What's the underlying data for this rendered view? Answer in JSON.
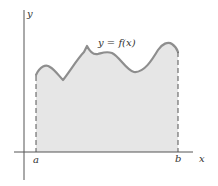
{
  "figure": {
    "labels": {
      "y_axis": "y",
      "x_axis": "x",
      "curve": "y = f(x)",
      "a": "a",
      "b": "b"
    },
    "colors": {
      "axis": "#555555",
      "curve": "#8e8e8e",
      "fill": "#e6e6e6",
      "dash": "#555555",
      "text": "#333333"
    }
  }
}
